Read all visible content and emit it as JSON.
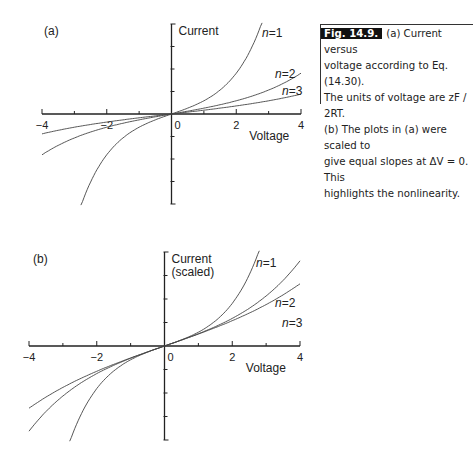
{
  "figure": {
    "label": "Fig. 14.9.",
    "caption_lines": [
      "(a) Current versus",
      "voltage according to Eq. (14.30).",
      "The units of voltage are zF / 2RT.",
      "(b) The plots in (a) were scaled to",
      "give equal slopes at ΔV = 0. This",
      "highlights the nonlinearity."
    ]
  },
  "chart_data": [
    {
      "type": "line",
      "panel": "(a)",
      "title": "",
      "xlabel": "Voltage",
      "ylabel": "Current",
      "xlim": [
        -4,
        4
      ],
      "ylim": [
        -4,
        4
      ],
      "xticks": [
        -4,
        -3,
        -2,
        -1,
        0,
        1,
        2,
        3,
        4
      ],
      "xtick_labels": [
        "-4",
        "-2",
        "0",
        "2",
        "4"
      ],
      "yticks_labeled": false,
      "grid": false,
      "formula": "I = 0.5*sinh(V/n)",
      "series": [
        {
          "name": "n=1",
          "n": 1,
          "scale": 0.5,
          "x": [
            -2.8,
            -2,
            -1,
            0,
            1,
            2,
            2.8
          ],
          "y": [
            -4.11,
            -1.81,
            -0.59,
            0,
            0.59,
            1.81,
            4.11
          ]
        },
        {
          "name": "n=2",
          "n": 2,
          "scale": 0.5,
          "x": [
            -4,
            -3,
            -2,
            -1,
            0,
            1,
            2,
            3,
            4
          ],
          "y": [
            -1.81,
            -1.06,
            -0.59,
            -0.26,
            0,
            0.26,
            0.59,
            1.06,
            1.81
          ]
        },
        {
          "name": "n=3",
          "n": 3,
          "scale": 0.5,
          "x": [
            -4,
            -3,
            -2,
            -1,
            0,
            1,
            2,
            3,
            4
          ],
          "y": [
            -0.88,
            -0.59,
            -0.36,
            -0.17,
            0,
            0.17,
            0.36,
            0.59,
            0.88
          ]
        }
      ]
    },
    {
      "type": "line",
      "panel": "(b)",
      "title": "",
      "xlabel": "Voltage",
      "ylabel": "Current\n(scaled)",
      "xlim": [
        -4,
        4
      ],
      "ylim": [
        -4,
        4
      ],
      "xticks": [
        -4,
        -3,
        -2,
        -1,
        0,
        1,
        2,
        3,
        4
      ],
      "xtick_labels": [
        "-4",
        "-2",
        "0",
        "2",
        "4"
      ],
      "yticks_labeled": false,
      "grid": false,
      "formula": "I = 0.5*n*sinh(V/n)",
      "series": [
        {
          "name": "n=1",
          "n": 1,
          "scale": 0.5,
          "x": [
            -2.8,
            -2,
            -1,
            0,
            1,
            2,
            2.8
          ],
          "y": [
            -4.11,
            -1.81,
            -0.59,
            0,
            0.59,
            1.81,
            4.11
          ]
        },
        {
          "name": "n=2",
          "n": 2,
          "scale": 1.0,
          "x": [
            -4,
            -3,
            -2,
            -1,
            0,
            1,
            2,
            3,
            4
          ],
          "y": [
            -3.63,
            -2.13,
            -1.18,
            -0.52,
            0,
            0.52,
            1.18,
            2.13,
            3.63
          ]
        },
        {
          "name": "n=3",
          "n": 3,
          "scale": 1.5,
          "x": [
            -4,
            -3,
            -2,
            -1,
            0,
            1,
            2,
            3,
            4
          ],
          "y": [
            -2.64,
            -1.76,
            -1.08,
            -0.51,
            0,
            0.51,
            1.08,
            1.76,
            2.64
          ]
        }
      ]
    }
  ],
  "panels": [
    {
      "label": "(a)",
      "ylabel_lines": [
        "Current"
      ],
      "xlabel": "Voltage",
      "frame": {
        "x0": 42,
        "x4": 301,
        "y0": 114,
        "ytop": 24,
        "ybot": 204,
        "yunit": 22.5
      },
      "series_labels": [
        {
          "text_n": "n",
          "text_rest": "=1",
          "x": 262,
          "y": 37
        },
        {
          "text_n": "n",
          "text_rest": "=2",
          "x": 275,
          "y": 78
        },
        {
          "text_n": "n",
          "text_rest": "=3",
          "x": 282,
          "y": 95
        }
      ]
    },
    {
      "label": "(b)",
      "ylabel_lines": [
        "Current",
        "(scaled)"
      ],
      "xlabel": "Voltage",
      "frame": {
        "x0": 29,
        "x4": 300,
        "y0": 346,
        "ytop": 252,
        "ybot": 440,
        "yunit": 23.5
      },
      "series_labels": [
        {
          "text_n": "n",
          "text_rest": "=1",
          "x": 256,
          "y": 267
        },
        {
          "text_n": "n",
          "text_rest": "=2",
          "x": 275,
          "y": 307
        },
        {
          "text_n": "n",
          "text_rest": "=3",
          "x": 282,
          "y": 327
        }
      ]
    }
  ]
}
